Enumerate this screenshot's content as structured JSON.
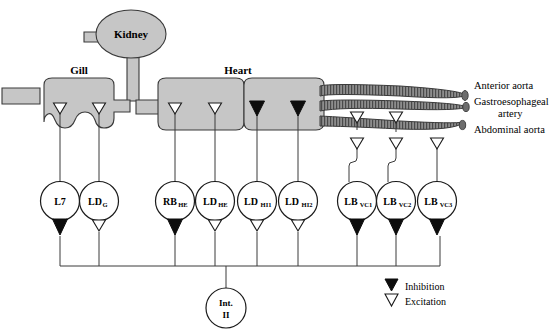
{
  "figure": {
    "background": "#ffffff",
    "organ_fill": "#c6c6c6",
    "organ_stroke": "#3a3a3a",
    "vessel_fill": "#8e8e8e",
    "line_color": "#3a3a3a"
  },
  "organs": [
    {
      "id": "kidney",
      "label": "Kidney",
      "shape": "ellipse"
    },
    {
      "id": "gill",
      "label": "Gill",
      "shape": "scalloped-block"
    },
    {
      "id": "heart",
      "label": "Heart",
      "shape": "block"
    }
  ],
  "vessels": [
    {
      "id": "anterior-aorta",
      "label": "Anterior aorta"
    },
    {
      "id": "gastroesophageal-artery",
      "label": "Gastroesophageal",
      "label2": "artery"
    },
    {
      "id": "abdominal-aorta",
      "label": "Abdominal aorta"
    }
  ],
  "neurons": [
    {
      "id": "l7",
      "base": "L7",
      "sub": "",
      "target": "gill",
      "target_synapse": "excitation",
      "bus_synapse": "inhibition"
    },
    {
      "id": "ldg",
      "base": "LD",
      "sub": "G",
      "target": "gill",
      "target_synapse": "excitation",
      "bus_synapse": "excitation"
    },
    {
      "id": "rbhe",
      "base": "RB",
      "sub": "HE",
      "target": "heart",
      "target_synapse": "excitation",
      "bus_synapse": "inhibition"
    },
    {
      "id": "ldhe",
      "base": "LD",
      "sub": "HE",
      "target": "heart",
      "target_synapse": "excitation",
      "bus_synapse": "excitation"
    },
    {
      "id": "ldhi1",
      "base": "LD",
      "sub": "HI1",
      "target": "heart",
      "target_synapse": "inhibition",
      "bus_synapse": "excitation"
    },
    {
      "id": "ldhi2",
      "base": "LD",
      "sub": "HI2",
      "target": "heart",
      "target_synapse": "inhibition",
      "bus_synapse": "excitation"
    },
    {
      "id": "lbvc1",
      "base": "LB",
      "sub": "VC1",
      "target": "abdominal-aorta",
      "target_synapse": "excitation",
      "bus_synapse": "inhibition"
    },
    {
      "id": "lbvc2",
      "base": "LB",
      "sub": "VC2",
      "target": "abdominal-aorta",
      "target_synapse": "excitation",
      "bus_synapse": "inhibition"
    },
    {
      "id": "lbvc3",
      "base": "LB",
      "sub": "VC3",
      "target": "abdominal-aorta",
      "target_synapse": "excitation",
      "bus_synapse": "inhibition"
    }
  ],
  "interneuron": {
    "id": "int2",
    "line1": "Int.",
    "line2": "II"
  },
  "legend": {
    "items": [
      {
        "id": "inhibition",
        "label": "Inhibition",
        "marker": "filled-triangle"
      },
      {
        "id": "excitation",
        "label": "Excitation",
        "marker": "open-triangle"
      }
    ]
  }
}
